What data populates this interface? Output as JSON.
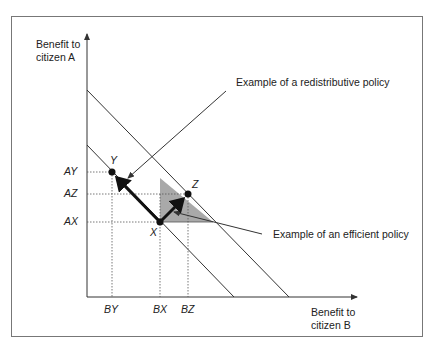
{
  "diagram": {
    "axes": {
      "y_label_line1": "Benefit to",
      "y_label_line2": "citizen A",
      "x_label_line1": "Benefit to",
      "x_label_line2": "citizen B"
    },
    "y_ticks": [
      "AY",
      "AZ",
      "AX"
    ],
    "x_ticks": [
      "BY",
      "BX",
      "BZ"
    ],
    "points": [
      {
        "name": "Y",
        "label": "Y"
      },
      {
        "name": "X",
        "label": "X"
      },
      {
        "name": "Z",
        "label": "Z"
      }
    ],
    "annotations": {
      "redistributive": "Example of a redistributive policy",
      "efficient": "Example of an efficient policy"
    },
    "colors": {
      "line": "#333333",
      "shade": "#a9a9a9",
      "frame": "#777777"
    }
  }
}
